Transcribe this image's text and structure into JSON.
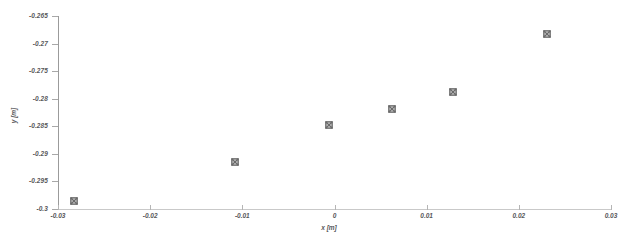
{
  "chart_data": {
    "type": "scatter",
    "title": "",
    "xlabel": "x [m]",
    "ylabel": "y [m]",
    "xlim": [
      -0.03,
      0.03
    ],
    "ylim": [
      -0.3,
      -0.265
    ],
    "xticks": [
      -0.03,
      -0.02,
      -0.01,
      0,
      0.01,
      0.02,
      0.03
    ],
    "xtick_labels": [
      "-0.03",
      "-0.02",
      "-0.01",
      "0",
      "0.01",
      "0.02",
      "0.03"
    ],
    "yticks": [
      -0.3,
      -0.295,
      -0.29,
      -0.285,
      -0.28,
      -0.275,
      -0.27,
      -0.265
    ],
    "ytick_labels": [
      "-0.3",
      "-0.295",
      "-0.29",
      "-0.285",
      "-0.28",
      "-0.275",
      "-0.27",
      "-0.265"
    ],
    "grid": false,
    "legend": null,
    "marker": "x-square",
    "marker_color": "#6b6b6b",
    "series": [
      {
        "name": "data",
        "x": [
          -0.0283,
          -0.0108,
          -0.0006,
          0.0062,
          0.0129,
          0.0231
        ],
        "y": [
          -0.2985,
          -0.2915,
          -0.2848,
          -0.2819,
          -0.2788,
          -0.2683
        ]
      }
    ]
  },
  "figure": {
    "background": "#ffffff",
    "axis_color": "#9b9b9b",
    "tick_color": "#a8a8a8",
    "text_color": "#58585a"
  }
}
